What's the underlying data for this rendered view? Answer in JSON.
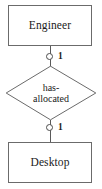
{
  "diagram": {
    "type": "entity-relationship-diagram",
    "entities": [
      {
        "name": "Engineer",
        "position": "top"
      },
      {
        "name": "Desktop",
        "position": "bottom"
      }
    ],
    "relationship": {
      "line1": "has-",
      "line2": "allocated",
      "full_label": "has-allocated",
      "shape": "diamond"
    },
    "cardinalities": [
      {
        "value": "1",
        "side": "upper",
        "marker": "circle"
      },
      {
        "value": "1",
        "side": "lower",
        "marker": "circle"
      }
    ],
    "colors": {
      "background": "#ffffff",
      "box_fill": "#ffffff",
      "box_border": "#6b6b6b",
      "diamond_border": "#6b6b6b",
      "line": "#5a5a5a",
      "marker_border": "#4d4d4d",
      "text": "#1a1a1a"
    }
  }
}
